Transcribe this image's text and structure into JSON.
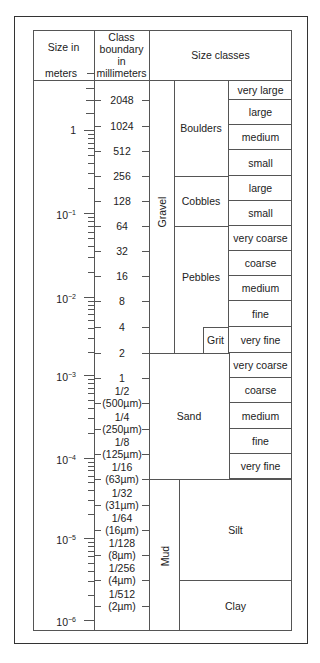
{
  "headers": {
    "size_in_meters_line1": "Size in",
    "size_in_meters_line2": "meters",
    "class_boundary": [
      "Class",
      "boundary",
      "in",
      "millimeters"
    ],
    "size_classes": "Size classes"
  },
  "meter_labels": [
    {
      "label": "1",
      "exp": "",
      "y": 130
    },
    {
      "label": "10",
      "exp": "−1",
      "y": 213
    },
    {
      "label": "10",
      "exp": "−2",
      "y": 297
    },
    {
      "label": "10",
      "exp": "−3",
      "y": 375
    },
    {
      "label": "10",
      "exp": "−4",
      "y": 458
    },
    {
      "label": "10",
      "exp": "−5",
      "y": 538
    },
    {
      "label": "10",
      "exp": "−6",
      "y": 620
    }
  ],
  "class_boundaries": [
    {
      "value": "2048",
      "sub": "",
      "y": 100
    },
    {
      "value": "1024",
      "sub": "",
      "y": 126
    },
    {
      "value": "512",
      "sub": "",
      "y": 151
    },
    {
      "value": "256",
      "sub": "",
      "y": 176
    },
    {
      "value": "128",
      "sub": "",
      "y": 201
    },
    {
      "value": "64",
      "sub": "",
      "y": 226
    },
    {
      "value": "32",
      "sub": "",
      "y": 251
    },
    {
      "value": "16",
      "sub": "",
      "y": 276
    },
    {
      "value": "8",
      "sub": "",
      "y": 301
    },
    {
      "value": "4",
      "sub": "",
      "y": 327
    },
    {
      "value": "2",
      "sub": "",
      "y": 353
    },
    {
      "value": "1",
      "sub": "",
      "y": 378
    },
    {
      "value": "1/2",
      "sub": "(500µm)",
      "y": 403
    },
    {
      "value": "1/4",
      "sub": "(250µm)",
      "y": 429
    },
    {
      "value": "1/8",
      "sub": "(125µm)",
      "y": 454
    },
    {
      "value": "1/16",
      "sub": "(63µm)",
      "y": 479
    },
    {
      "value": "1/32",
      "sub": "(31µm)",
      "y": 505
    },
    {
      "value": "1/64",
      "sub": "(16µm)",
      "y": 530
    },
    {
      "value": "1/128",
      "sub": "(8µm)",
      "y": 555
    },
    {
      "value": "1/256",
      "sub": "(4µm)",
      "y": 580
    },
    {
      "value": "1/512",
      "sub": "(2µm)",
      "y": 606
    }
  ],
  "groups": {
    "gravel": "Gravel",
    "mud": "Mud",
    "boulders": "Boulders",
    "cobbles": "Cobbles",
    "pebbles": "Pebbles",
    "grit": "Grit",
    "sand": "Sand",
    "silt": "Silt",
    "clay": "Clay"
  },
  "subclasses": [
    {
      "label": "very large",
      "top": 80,
      "bottom": 100
    },
    {
      "label": "large",
      "top": 100,
      "bottom": 125
    },
    {
      "label": "medium",
      "top": 125,
      "bottom": 150
    },
    {
      "label": "small",
      "top": 150,
      "bottom": 176
    },
    {
      "label": "large",
      "top": 176,
      "bottom": 201
    },
    {
      "label": "small",
      "top": 201,
      "bottom": 226
    },
    {
      "label": "very coarse",
      "top": 226,
      "bottom": 251
    },
    {
      "label": "coarse",
      "top": 251,
      "bottom": 276
    },
    {
      "label": "medium",
      "top": 276,
      "bottom": 301
    },
    {
      "label": "fine",
      "top": 301,
      "bottom": 327
    },
    {
      "label": "very fine",
      "top": 327,
      "bottom": 353
    },
    {
      "label": "very coarse",
      "top": 353,
      "bottom": 378
    },
    {
      "label": "coarse",
      "top": 378,
      "bottom": 403
    },
    {
      "label": "medium",
      "top": 403,
      "bottom": 429
    },
    {
      "label": "fine",
      "top": 429,
      "bottom": 454
    },
    {
      "label": "very fine",
      "top": 454,
      "bottom": 479
    }
  ]
}
